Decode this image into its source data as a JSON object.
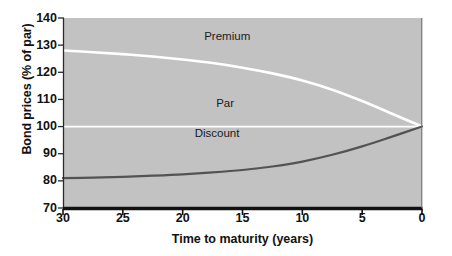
{
  "figure": {
    "width": 452,
    "height": 256,
    "background": "#ffffff",
    "plot_background": "#c2c2c2",
    "axis_color": "#111111"
  },
  "chart_data": {
    "type": "line",
    "title": "",
    "xlabel": "Time to maturity (years)",
    "ylabel": "Bond prices (% of par)",
    "xlim": [
      30,
      0
    ],
    "ylim": [
      70,
      140
    ],
    "xticks": [
      30,
      25,
      20,
      15,
      10,
      5,
      0
    ],
    "xtick_labels": [
      "30",
      "25",
      "20",
      "15",
      "10",
      "5",
      "0"
    ],
    "yticks": [
      70,
      80,
      90,
      100,
      110,
      120,
      130,
      140
    ],
    "ytick_labels": [
      "70",
      "80",
      "90",
      "100",
      "110",
      "120",
      "130",
      "140"
    ],
    "grid": false,
    "legend_position": "inline-annotations",
    "x_axis_direction": "reversed",
    "series": [
      {
        "name": "Premium",
        "color": "#ffffff",
        "width": 2.6,
        "label": "Premium",
        "x": [
          30,
          27.5,
          25,
          22.5,
          20,
          17.5,
          15,
          12.5,
          10,
          7.5,
          5,
          2.5,
          0
        ],
        "values": [
          128.0,
          127.4,
          126.7,
          125.8,
          124.7,
          123.4,
          121.7,
          119.6,
          117.0,
          113.6,
          109.4,
          104.7,
          100.0
        ]
      },
      {
        "name": "Par",
        "color": "#ffffff",
        "width": 1.7,
        "label": "Par",
        "x": [
          30,
          0
        ],
        "values": [
          100,
          100
        ]
      },
      {
        "name": "Discount",
        "color": "#535353",
        "width": 2.2,
        "label": "Discount",
        "x": [
          30,
          27.5,
          25,
          22.5,
          20,
          17.5,
          15,
          12.5,
          10,
          7.5,
          5,
          2.5,
          0
        ],
        "values": [
          81.0,
          81.2,
          81.5,
          81.9,
          82.4,
          83.1,
          84.0,
          85.3,
          87.1,
          89.6,
          92.7,
          96.3,
          100.0
        ]
      }
    ],
    "annotations": [
      {
        "text": "Premium",
        "x": 18.2,
        "y": 133.0
      },
      {
        "text": "Par",
        "x": 17.2,
        "y": 108.5
      },
      {
        "text": "Discount",
        "x": 19.0,
        "y": 97.2
      }
    ]
  }
}
